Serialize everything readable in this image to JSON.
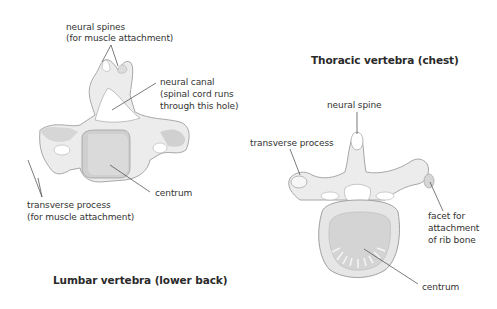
{
  "lumbar": {
    "title": "Lumbar vertebra (lower back)",
    "labels": {
      "neural_spines_1": "neural spines",
      "neural_spines_2": "(for muscle attachment)",
      "neural_canal_1": "neural canal",
      "neural_canal_2": "(spinal cord runs",
      "neural_canal_3": "through this hole)",
      "centrum": "centrum",
      "transverse_1": "transverse process",
      "transverse_2": "(for muscle attachment)"
    }
  },
  "thoracic": {
    "title": "Thoracic vertebra (chest)",
    "labels": {
      "neural_spine": "neural spine",
      "transverse": "transverse process",
      "facet_1": "facet for",
      "facet_2": "attachment",
      "facet_3": "of rib bone",
      "centrum": "centrum"
    }
  },
  "colors": {
    "bone_light": "#eeeeee",
    "bone_mid": "#d8d8d8",
    "bone_dark": "#c2c2c2",
    "outline": "#9a9a9a",
    "leader_line": "#444444",
    "text": "#333333"
  }
}
